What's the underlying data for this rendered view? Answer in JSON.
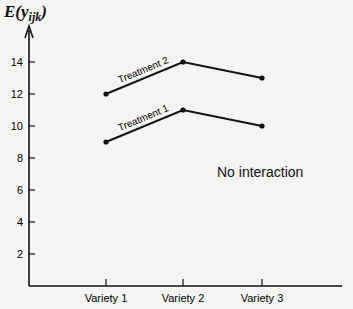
{
  "chart_data": {
    "type": "line",
    "title": "",
    "ylabel": "E(y_ijk)",
    "ylabel_main": "E(y",
    "ylabel_sub": "ijk",
    "ylabel_close": ")",
    "xlabel": "",
    "categories": [
      "Variety 1",
      "Variety 2",
      "Variety 3"
    ],
    "series": [
      {
        "name": "Treatment 1",
        "values": [
          9,
          11,
          10
        ]
      },
      {
        "name": "Treatment 2",
        "values": [
          12,
          14,
          13
        ]
      }
    ],
    "yticks": [
      2,
      4,
      6,
      8,
      10,
      12,
      14
    ],
    "ylim": [
      0,
      15.5
    ],
    "grid": false,
    "legend": "inline labels on first segment",
    "annotations": [
      "No interaction"
    ]
  },
  "labels": {
    "annotation": "No interaction",
    "treatment1": "Treatment 1",
    "treatment2": "Treatment 2"
  }
}
